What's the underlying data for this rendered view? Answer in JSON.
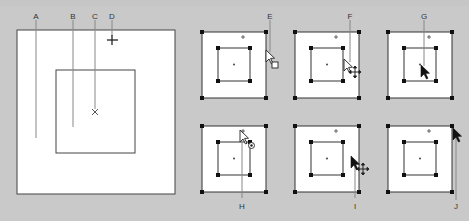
{
  "figure": {
    "background_color": "#c9c9c9",
    "panel_fill": "#ffffff",
    "stroke_color": "#333333",
    "callout_line_color": "#8a8a8a"
  },
  "labels": {
    "A": "A",
    "B": "B",
    "C": "C",
    "D": "D",
    "E": "E",
    "F": "F",
    "G": "G",
    "H": "H",
    "I": "I",
    "J": "J"
  },
  "main_diagram": {
    "outer_frame": "bounding-box",
    "inner_frame": "content-box",
    "center_marker": "x-center-point",
    "reference_marker": "crosshair-plus"
  },
  "panels": [
    {
      "id": "E",
      "position": "top-1",
      "cursor": "pointer-with-square"
    },
    {
      "id": "F",
      "position": "top-2",
      "cursor": "pointer-with-move-cross"
    },
    {
      "id": "G",
      "position": "top-3",
      "cursor": "solid-pointer"
    },
    {
      "id": "H",
      "position": "bottom-1",
      "cursor": "pointer-with-circle"
    },
    {
      "id": "I",
      "position": "bottom-2",
      "cursor": "solid-pointer-with-move-cross"
    },
    {
      "id": "J",
      "position": "bottom-3",
      "cursor": "solid-pointer-corner"
    }
  ]
}
